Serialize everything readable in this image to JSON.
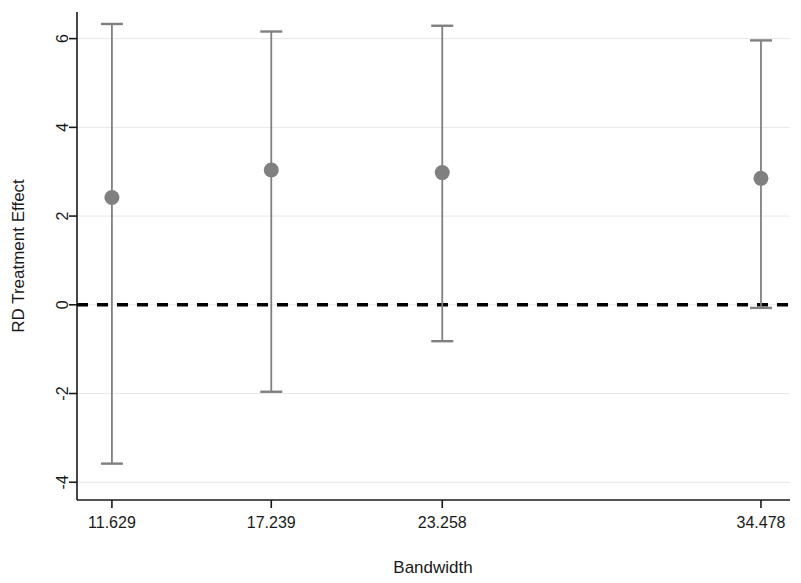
{
  "chart_data": {
    "type": "scatter",
    "title": "",
    "subtitle": "",
    "xlabel": "Bandwidth",
    "ylabel": "RD Treatment Effect",
    "categories": [
      "11.629",
      "17.239",
      "23.258",
      "34.478"
    ],
    "x": [
      11.629,
      17.239,
      23.258,
      34.478
    ],
    "values": [
      2.42,
      3.04,
      2.98,
      2.85
    ],
    "ci_lower": [
      -3.58,
      -1.96,
      -0.82,
      -0.07
    ],
    "ci_upper": [
      6.33,
      6.16,
      6.29,
      5.96
    ],
    "series": [
      {
        "name": "RD Treatment Effect",
        "values": [
          2.42,
          3.04,
          2.98,
          2.85
        ],
        "ci_lower": [
          -3.58,
          -1.96,
          -0.82,
          -0.07
        ],
        "ci_upper": [
          6.33,
          6.16,
          6.29,
          5.96
        ]
      }
    ],
    "points": [
      {
        "bandwidth": 11.629,
        "estimate": 2.42,
        "ci_lower": -3.58,
        "ci_upper": 6.33
      },
      {
        "bandwidth": 17.239,
        "estimate": 3.04,
        "ci_lower": -1.96,
        "ci_upper": 6.16
      },
      {
        "bandwidth": 23.258,
        "estimate": 2.98,
        "ci_lower": -0.82,
        "ci_upper": 6.29
      },
      {
        "bandwidth": 34.478,
        "estimate": 2.85,
        "ci_lower": -0.07,
        "ci_upper": 5.96
      }
    ],
    "xticks": [
      11.629,
      17.239,
      23.258,
      34.478
    ],
    "xtick_labels": [
      "11.629",
      "17.239",
      "23.258",
      "34.478"
    ],
    "yticks": [
      -4,
      -2,
      0,
      2,
      4,
      6
    ],
    "ytick_labels": [
      "-4",
      "-2",
      "0",
      "2",
      "4",
      "6"
    ],
    "xlim": [
      10.4,
      35.5
    ],
    "ylim": [
      -4.4,
      6.6
    ],
    "grid": "horizontal",
    "legend": "none",
    "reference_line": {
      "value": 0,
      "orientation": "horizontal",
      "style": "dashed",
      "color": "#000000"
    },
    "colors": {
      "marker": "#808080",
      "errorbar": "#808080",
      "axis": "#1a1a1a",
      "grid": "#e8e8e8",
      "reference": "#000000",
      "background": "#ffffff"
    }
  },
  "axes": {
    "x_title": "Bandwidth",
    "y_title": "RD Treatment Effect"
  }
}
